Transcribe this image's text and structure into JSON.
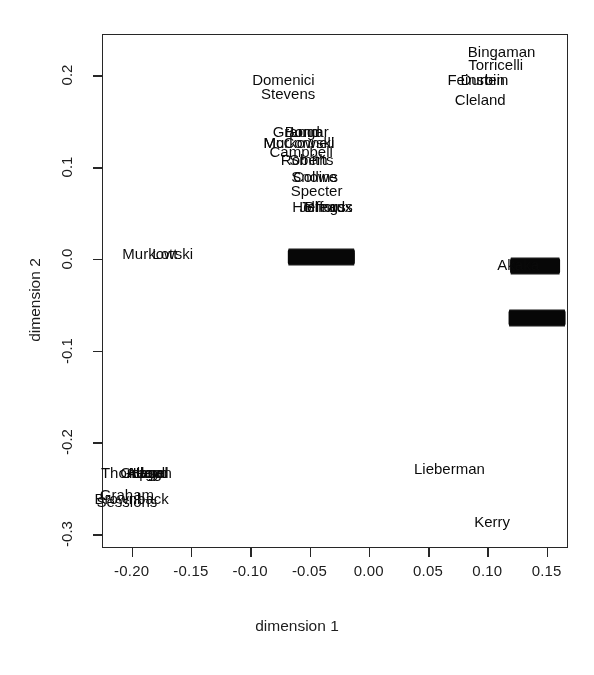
{
  "figure": {
    "type": "scatter-text-plot",
    "background": "#fdfdfc",
    "ink_color": "#101010"
  },
  "chart_data": {
    "type": "scatter",
    "title": "",
    "subtitle": "",
    "xlabel": "dimension 1",
    "ylabel": "dimension 2",
    "xlim": [
      -0.225,
      0.168
    ],
    "ylim": [
      -0.315,
      0.245
    ],
    "grid": false,
    "legend": null,
    "legend_position": "none",
    "xticks": [
      -0.2,
      -0.15,
      -0.1,
      -0.05,
      0.0,
      0.05,
      0.1,
      0.15
    ],
    "xticklabels": [
      "-0.20",
      "-0.15",
      "-0.10",
      "-0.05",
      "0.00",
      "0.05",
      "0.10",
      "0.15"
    ],
    "yticks": [
      -0.3,
      -0.2,
      -0.1,
      0.0,
      0.1,
      0.2
    ],
    "yticklabels": [
      "-0.3",
      "-0.2",
      "-0.1",
      "0.0",
      "0.1",
      "0.2"
    ],
    "marker_style": "text-label",
    "note": "Points are drawn as overlapping senator name labels; dense regions render as solid black bands.",
    "points": [
      {
        "label": "Bingaman",
        "x": 0.112,
        "y": 0.227
      },
      {
        "label": "Torricelli",
        "x": 0.107,
        "y": 0.212
      },
      {
        "label": "Feinstein",
        "x": 0.092,
        "y": 0.196
      },
      {
        "label": "Durbin",
        "x": 0.096,
        "y": 0.196
      },
      {
        "label": "Cleland",
        "x": 0.094,
        "y": 0.174
      },
      {
        "label": "Domenici",
        "x": -0.072,
        "y": 0.196
      },
      {
        "label": "Stevens",
        "x": -0.068,
        "y": 0.181
      },
      {
        "label": "Gramm",
        "x": -0.06,
        "y": 0.139
      },
      {
        "label": "Bond",
        "x": -0.056,
        "y": 0.139
      },
      {
        "label": "Lugar",
        "x": -0.05,
        "y": 0.139
      },
      {
        "label": "McConnell",
        "x": -0.059,
        "y": 0.127
      },
      {
        "label": "Murkowski",
        "x": -0.059,
        "y": 0.127
      },
      {
        "label": "Campbell",
        "x": -0.057,
        "y": 0.118
      },
      {
        "label": "Roberts",
        "x": -0.052,
        "y": 0.109
      },
      {
        "label": "Smith",
        "x": -0.051,
        "y": 0.109
      },
      {
        "label": "Snowe",
        "x": -0.046,
        "y": 0.09
      },
      {
        "label": "Collins",
        "x": -0.045,
        "y": 0.09
      },
      {
        "label": "Specter",
        "x": -0.044,
        "y": 0.075
      },
      {
        "label": "Hollings",
        "x": -0.042,
        "y": 0.058
      },
      {
        "label": "Jeffords",
        "x": -0.036,
        "y": 0.058
      },
      {
        "label": "Breaux",
        "x": -0.034,
        "y": 0.058
      },
      {
        "label": "Murkowski",
        "x": -0.178,
        "y": 0.006
      },
      {
        "label": "Lott",
        "x": -0.172,
        "y": 0.006
      },
      {
        "label": "Akaka",
        "x": 0.126,
        "y": -0.006
      },
      {
        "label": "Lieberman",
        "x": 0.068,
        "y": -0.228
      },
      {
        "label": "Kerry",
        "x": 0.104,
        "y": -0.286
      },
      {
        "label": "Thompson",
        "x": -0.196,
        "y": -0.232
      },
      {
        "label": "Gregg",
        "x": -0.192,
        "y": -0.232
      },
      {
        "label": "Allard",
        "x": -0.188,
        "y": -0.232
      },
      {
        "label": "Hagel",
        "x": -0.186,
        "y": -0.232
      },
      {
        "label": "Lloyd",
        "x": -0.184,
        "y": -0.232
      },
      {
        "label": "Graham",
        "x": -0.204,
        "y": -0.256
      },
      {
        "label": "Sessions",
        "x": -0.204,
        "y": -0.264
      },
      {
        "label": "Brownback",
        "x": -0.2,
        "y": -0.26
      }
    ],
    "dense_clusters": [
      {
        "name": "center-zero-band",
        "x_center": -0.04,
        "y_center": 0.002,
        "x_extent": 0.056,
        "label_count": 30
      },
      {
        "name": "right-upper-band",
        "x_center": 0.14,
        "y_center": -0.008,
        "x_extent": 0.042,
        "label_count": 22
      },
      {
        "name": "right-lower-band",
        "x_center": 0.142,
        "y_center": -0.064,
        "x_extent": 0.048,
        "label_count": 26
      }
    ]
  },
  "axes": {
    "x_title": "dimension 1",
    "y_title": "dimension 2"
  }
}
